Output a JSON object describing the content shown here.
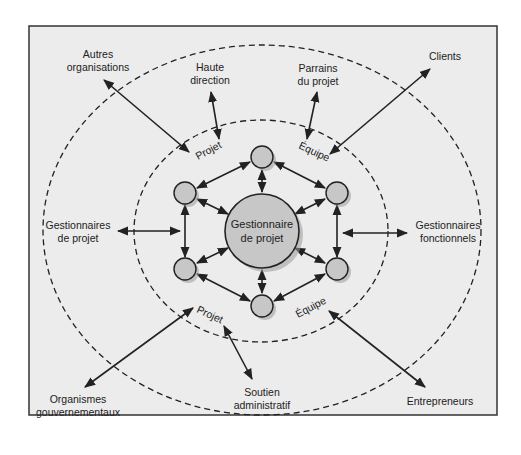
{
  "diagram": {
    "colors": {
      "background": "#ffffff",
      "panel": "#ececec",
      "frame": "#333333",
      "line": "#222222",
      "node_fill": "#c7c7c7",
      "node_shadow": "#9a9a9a"
    },
    "center": {
      "label_line1": "Gestionnaire",
      "label_line2": "de projet"
    },
    "ring_labels": {
      "top_left": "Projet",
      "top_right": "Équipe",
      "bottom_left": "Projet",
      "bottom_right": "Équipe"
    },
    "stakeholders": {
      "autres_organisations": {
        "line1": "Autres",
        "line2": "organisations"
      },
      "haute_direction": {
        "line1": "Haute",
        "line2": "direction"
      },
      "parrains": {
        "line1": "Parrains",
        "line2": "du projet"
      },
      "clients": {
        "line1": "Clients"
      },
      "gestionnaires_projet": {
        "line1": "Gestionnaires",
        "line2": "de projet"
      },
      "gestionnaires_fonctionnels": {
        "line1": "Gestionnaires",
        "line2": "fonctionnels"
      },
      "organismes": {
        "line1": "Organismes",
        "line2": "gouvernementaux"
      },
      "soutien": {
        "line1": "Soutien",
        "line2": "administratif"
      },
      "entrepreneurs": {
        "line1": "Entrepreneurs"
      }
    },
    "team_nodes": [
      {
        "id": "top",
        "x": 262,
        "y": 157
      },
      {
        "id": "upper-left",
        "x": 185,
        "y": 193
      },
      {
        "id": "upper-right",
        "x": 337,
        "y": 193
      },
      {
        "id": "lower-left",
        "x": 185,
        "y": 269
      },
      {
        "id": "lower-right",
        "x": 337,
        "y": 269
      },
      {
        "id": "bottom",
        "x": 262,
        "y": 306
      }
    ]
  }
}
